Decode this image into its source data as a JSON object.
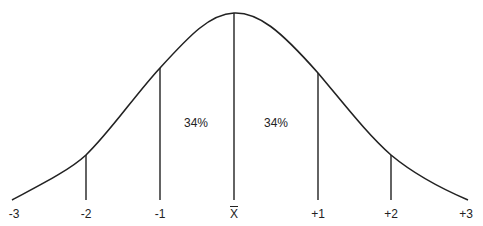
{
  "diagram": {
    "title": "",
    "type": "normal-distribution-curve",
    "axis_labels": [
      {
        "text": "-3",
        "x": 14
      },
      {
        "text": "-2",
        "x": 86
      },
      {
        "text": "-1",
        "x": 160
      },
      {
        "text": "X",
        "x": 234,
        "overline": true
      },
      {
        "text": "+1",
        "x": 318
      },
      {
        "text": "+2",
        "x": 391
      },
      {
        "text": "+3",
        "x": 466
      }
    ],
    "region_labels": [
      {
        "text": "34%",
        "x": 196
      },
      {
        "text": "34%",
        "x": 276
      }
    ],
    "line_color": "#222222"
  }
}
